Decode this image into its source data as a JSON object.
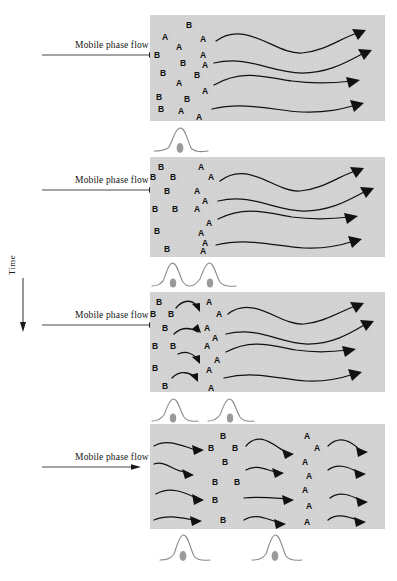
{
  "figure": {
    "time_axis_label": "Time",
    "time_axis_direction": "downward",
    "solute_labels": [
      "A",
      "B"
    ],
    "panel_background_color": "#d6d6d6",
    "ink_color": "#101010",
    "band_color": "#9a9a9a",
    "trace_color": "#8a8a8a"
  },
  "flow_labels": [
    {
      "text": "Mobile phase flow"
    },
    {
      "text": "Mobile phase flow"
    },
    {
      "text": "Mobile phase flow"
    },
    {
      "text": "Mobile phase flow"
    }
  ],
  "panels": [
    {
      "id": "panel-1",
      "stage": "initial-mixed-zone",
      "caption": "Solutes A and B fully overlapped in a single mixed band at the column inlet",
      "solutes": [
        {
          "label": "B",
          "x": 36,
          "y": 6
        },
        {
          "label": "A",
          "x": 12,
          "y": 18
        },
        {
          "label": "A",
          "x": 50,
          "y": 20
        },
        {
          "label": "A",
          "x": 26,
          "y": 28
        },
        {
          "label": "B",
          "x": 4,
          "y": 36
        },
        {
          "label": "A",
          "x": 50,
          "y": 36
        },
        {
          "label": "B",
          "x": 30,
          "y": 44
        },
        {
          "label": "A",
          "x": 52,
          "y": 46
        },
        {
          "label": "B",
          "x": 10,
          "y": 54
        },
        {
          "label": "B",
          "x": 44,
          "y": 56
        },
        {
          "label": "A",
          "x": 26,
          "y": 64
        },
        {
          "label": "A",
          "x": 52,
          "y": 72
        },
        {
          "label": "B",
          "x": 6,
          "y": 78
        },
        {
          "label": "B",
          "x": 34,
          "y": 80
        },
        {
          "label": "B",
          "x": 8,
          "y": 90
        },
        {
          "label": "A",
          "x": 28,
          "y": 92
        },
        {
          "label": "A",
          "x": 46,
          "y": 98
        }
      ],
      "arrow_count": 4
    },
    {
      "id": "panel-2",
      "stage": "partial-separation",
      "caption": "B band begins to lag behind the faster A band; zones start to resolve",
      "solutes": [
        {
          "label": "B",
          "x": 8,
          "y": 6
        },
        {
          "label": "A",
          "x": 48,
          "y": 6
        },
        {
          "label": "B",
          "x": 0,
          "y": 16
        },
        {
          "label": "B",
          "x": 20,
          "y": 16
        },
        {
          "label": "A",
          "x": 58,
          "y": 16
        },
        {
          "label": "B",
          "x": 14,
          "y": 30
        },
        {
          "label": "A",
          "x": 44,
          "y": 30
        },
        {
          "label": "A",
          "x": 52,
          "y": 40
        },
        {
          "label": "B",
          "x": 2,
          "y": 48
        },
        {
          "label": "B",
          "x": 22,
          "y": 48
        },
        {
          "label": "A",
          "x": 44,
          "y": 48
        },
        {
          "label": "A",
          "x": 56,
          "y": 62
        },
        {
          "label": "B",
          "x": 4,
          "y": 70
        },
        {
          "label": "A",
          "x": 48,
          "y": 72
        },
        {
          "label": "A",
          "x": 52,
          "y": 82
        },
        {
          "label": "B",
          "x": 14,
          "y": 88
        },
        {
          "label": "A",
          "x": 50,
          "y": 94
        }
      ],
      "arrow_count": 4
    },
    {
      "id": "panel-3",
      "stage": "resolved-zones-with-transfer",
      "caption": "A and B zones clearly resolved; curved arrows show partitioning between phases",
      "solutes": [
        {
          "label": "B",
          "x": 6,
          "y": 6
        },
        {
          "label": "A",
          "x": 56,
          "y": 6
        },
        {
          "label": "B",
          "x": 0,
          "y": 18
        },
        {
          "label": "B",
          "x": 18,
          "y": 18
        },
        {
          "label": "A",
          "x": 66,
          "y": 18
        },
        {
          "label": "B",
          "x": 12,
          "y": 32
        },
        {
          "label": "A",
          "x": 54,
          "y": 32
        },
        {
          "label": "A",
          "x": 62,
          "y": 42
        },
        {
          "label": "B",
          "x": 2,
          "y": 50
        },
        {
          "label": "B",
          "x": 20,
          "y": 50
        },
        {
          "label": "A",
          "x": 54,
          "y": 50
        },
        {
          "label": "A",
          "x": 64,
          "y": 64
        },
        {
          "label": "B",
          "x": 2,
          "y": 72
        },
        {
          "label": "A",
          "x": 56,
          "y": 74
        },
        {
          "label": "B",
          "x": 12,
          "y": 90
        },
        {
          "label": "A",
          "x": 58,
          "y": 92
        }
      ],
      "arrow_count": 4,
      "transfer_arrow_count": 4
    },
    {
      "id": "panel-4",
      "stage": "baseline-separated",
      "caption": "B and A bands fully separated with mobile phase flow arrows before, between and after them",
      "solutes": [
        {
          "label": "B",
          "x": 70,
          "y": 8
        },
        {
          "label": "A",
          "x": 154,
          "y": 8
        },
        {
          "label": "B",
          "x": 58,
          "y": 20
        },
        {
          "label": "B",
          "x": 82,
          "y": 20
        },
        {
          "label": "A",
          "x": 164,
          "y": 20
        },
        {
          "label": "B",
          "x": 72,
          "y": 34
        },
        {
          "label": "A",
          "x": 152,
          "y": 34
        },
        {
          "label": "A",
          "x": 156,
          "y": 48
        },
        {
          "label": "B",
          "x": 62,
          "y": 54
        },
        {
          "label": "B",
          "x": 84,
          "y": 54
        },
        {
          "label": "A",
          "x": 152,
          "y": 62
        },
        {
          "label": "B",
          "x": 62,
          "y": 72
        },
        {
          "label": "A",
          "x": 156,
          "y": 78
        },
        {
          "label": "B",
          "x": 70,
          "y": 92
        },
        {
          "label": "A",
          "x": 154,
          "y": 94
        }
      ],
      "arrow_count": 12
    }
  ],
  "chromatograms": [
    {
      "id": "chromatogram-1",
      "for_panel": "panel-1",
      "caption": "Single unresolved peak — A and B co-elute",
      "peaks": [
        {
          "label": "A+B",
          "center": 28,
          "height": 26,
          "width": 13,
          "resolved": false
        }
      ],
      "resolution": "none"
    },
    {
      "id": "chromatogram-2",
      "for_panel": "panel-2",
      "caption": "Two overlapping peaks — partial resolution",
      "peaks": [
        {
          "label": "B",
          "center": 20,
          "height": 24,
          "width": 12,
          "resolved": false
        },
        {
          "label": "A",
          "center": 56,
          "height": 24,
          "width": 12,
          "resolved": false
        }
      ],
      "resolution": "partial"
    },
    {
      "id": "chromatogram-3",
      "for_panel": "panel-3",
      "caption": "Two separated peaks returning to baseline",
      "peaks": [
        {
          "label": "B",
          "center": 20,
          "height": 22,
          "width": 11,
          "resolved": true
        },
        {
          "label": "A",
          "center": 76,
          "height": 22,
          "width": 11,
          "resolved": true
        }
      ],
      "resolution": "baseline"
    },
    {
      "id": "chromatogram-4",
      "for_panel": "panel-4",
      "caption": "Two widely spaced peaks — complete baseline separation",
      "peaks": [
        {
          "label": "B",
          "center": 30,
          "height": 26,
          "width": 11,
          "resolved": true
        },
        {
          "label": "A",
          "center": 122,
          "height": 26,
          "width": 11,
          "resolved": true
        }
      ],
      "resolution": "complete"
    }
  ]
}
